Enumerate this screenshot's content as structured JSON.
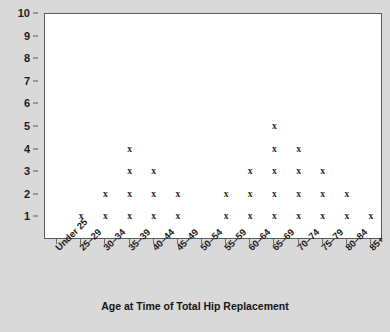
{
  "chart_data": {
    "type": "scatter",
    "plot_style": "dot-plot",
    "title": "",
    "xlabel": "Age at Time of Total Hip Replacement",
    "ylabel": "",
    "categories": [
      "Under 25",
      "25–29",
      "30–34",
      "35–39",
      "40–44",
      "45–49",
      "50–54",
      "55–59",
      "60–64",
      "65–69",
      "70–74",
      "75–79",
      "80–84",
      "85+"
    ],
    "values": [
      0,
      1,
      2,
      4,
      3,
      2,
      0,
      2,
      3,
      5,
      4,
      3,
      2,
      1
    ],
    "marker": "x",
    "marker_glyph": "×",
    "marker_color": "#2b2b2b",
    "ylim": [
      0,
      10
    ],
    "y_ticks": [
      1,
      2,
      3,
      4,
      5,
      6,
      7,
      8,
      9,
      10
    ],
    "y_tick_labels": [
      "1",
      "2",
      "3",
      "4",
      "5",
      "6",
      "7",
      "8",
      "9",
      "10"
    ],
    "grid": false,
    "legend": false,
    "total_count": 32,
    "background_color": "#d9d9d9",
    "plot_background_color": "#ffffff",
    "axis_color": "#5a5a5a"
  }
}
